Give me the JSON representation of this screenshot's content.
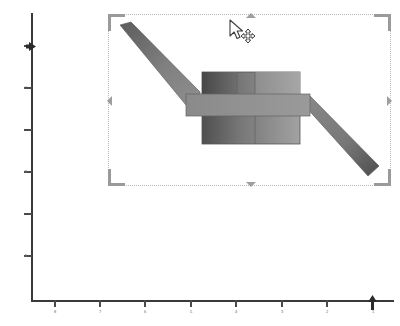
{
  "app": {
    "title": "CAD Shape Editor Canvas",
    "background_color": "#ffffff"
  },
  "rulers": {
    "vertical": {
      "name": "vertical-ruler",
      "axis_color": "#3a3a3a",
      "marker_icon": "right-arrow-marker",
      "marker_position_px": 46,
      "ticks": [
        {
          "y": 46,
          "label": ""
        },
        {
          "y": 88,
          "label": "C"
        },
        {
          "y": 130,
          "label": ""
        },
        {
          "y": 172,
          "label": "B"
        },
        {
          "y": 214,
          "label": ""
        },
        {
          "y": 256,
          "label": "A"
        }
      ]
    },
    "horizontal": {
      "name": "horizontal-ruler",
      "axis_color": "#3a3a3a",
      "marker_icon": "up-arrow-marker",
      "marker_position_px": 372,
      "ticks": [
        {
          "x": 54,
          "label": "8"
        },
        {
          "x": 99,
          "label": "7"
        },
        {
          "x": 144,
          "label": "6"
        },
        {
          "x": 190,
          "label": "5"
        },
        {
          "x": 235,
          "label": "4"
        },
        {
          "x": 281,
          "label": "3"
        },
        {
          "x": 326,
          "label": "2"
        },
        {
          "x": 372,
          "label": "1"
        }
      ]
    }
  },
  "selection": {
    "name": "selection-frame",
    "left": 108,
    "top": 14,
    "width": 283,
    "height": 172,
    "border_color": "#b9b9b9",
    "corner_color": "#9a9a9a",
    "handle_color": "#9e9e9e",
    "handles": [
      {
        "name": "resize-handle-top",
        "icon": "triangle-up-icon"
      },
      {
        "name": "resize-handle-right",
        "icon": "triangle-right-icon"
      },
      {
        "name": "resize-handle-bottom",
        "icon": "triangle-down-icon"
      },
      {
        "name": "resize-handle-left",
        "icon": "triangle-left-icon"
      }
    ]
  },
  "shape": {
    "name": "crank-shaft-shape",
    "description": "Z-shaped crank with central block body",
    "fill_dark": "#4a4a4a",
    "fill_mid": "#707070",
    "fill_light": "#9a9a9a",
    "stroke_color": "#5a5a5a",
    "parts": [
      {
        "name": "upper-left-arm",
        "tone": "dark-to-mid"
      },
      {
        "name": "central-block-body",
        "tone": "dark-to-light-gradient"
      },
      {
        "name": "horizontal-cross-band",
        "tone": "mid"
      },
      {
        "name": "lower-right-arm",
        "tone": "mid-to-dark"
      }
    ]
  },
  "cursor": {
    "name": "move-cursor",
    "icon": "arrow-with-move-cross-icon",
    "x": 228,
    "y": 19
  }
}
